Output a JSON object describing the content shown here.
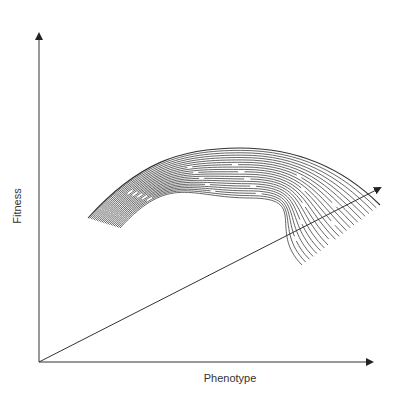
{
  "diagram": {
    "type": "fitness landscape (3D surface sketch)",
    "axes": {
      "x_label": "Phenotype",
      "y_label": "Fitness",
      "z_axis": "diagonal depth axis (unlabeled)"
    },
    "surface": {
      "description": "stacked hump-shaped curves forming a fitness surface, shifting down-right along the depth axis",
      "curve_count": 22
    },
    "colors": {
      "axis": "#333333",
      "curves": "#555555",
      "background": "#ffffff"
    }
  }
}
